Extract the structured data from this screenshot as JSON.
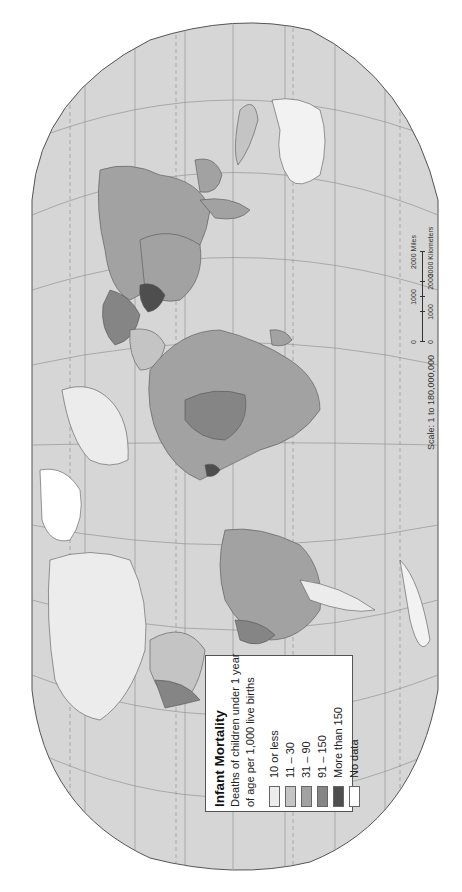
{
  "map": {
    "title": "Infant Mortality",
    "subtitle_line1": "Deaths of children under 1 year",
    "subtitle_line2": "of age per 1,000 live births",
    "orientation": "rotated 90° counter-clockwise",
    "colors": {
      "ocean": "#d6d6d6",
      "border": "#555555",
      "graticule": "#888888"
    }
  },
  "legend": {
    "items": [
      {
        "label": "10 or less",
        "color": "#ececec"
      },
      {
        "label": "11 – 30",
        "color": "#c4c4c4"
      },
      {
        "label": "31 – 90",
        "color": "#a2a2a2"
      },
      {
        "label": "91 – 150",
        "color": "#858585"
      },
      {
        "label": "More than 150",
        "color": "#4e4e4e"
      },
      {
        "label": "No data",
        "color": "#ffffff"
      }
    ]
  },
  "scale": {
    "text": "Scale: 1 to 180,000,000",
    "miles_ticks": [
      "0",
      "1000",
      "2000 Miles"
    ],
    "km_ticks": [
      "0",
      "1000",
      "2000",
      "3000 Kilometers"
    ]
  }
}
